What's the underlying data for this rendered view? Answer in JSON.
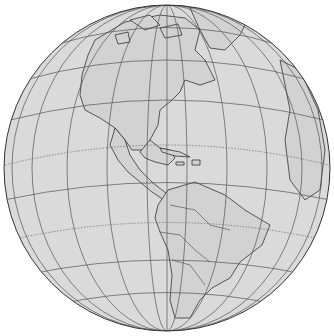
{
  "map": {
    "projection": "orthographic",
    "region": "Western Hemisphere (The Americas)",
    "colors": {
      "background": "#ffffff",
      "ocean": "#dadada",
      "land": "#d2d2d2",
      "outline": "#333333",
      "graticule": "#555555"
    },
    "features": [
      "North America",
      "Central America",
      "Caribbean",
      "South America",
      "Greenland",
      "Canadian Arctic Archipelago",
      "Western Europe (limb)",
      "West Africa (limb)"
    ],
    "graticule": {
      "meridians": true,
      "parallels": true,
      "tropics_dashed": true,
      "equator_dashed": true
    }
  }
}
